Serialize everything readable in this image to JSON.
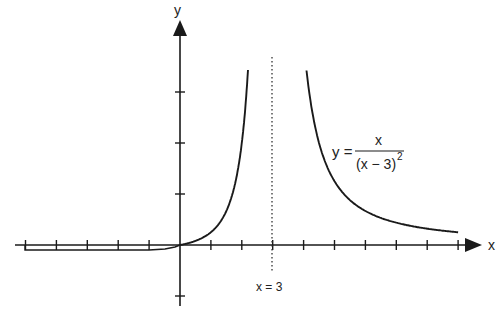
{
  "chart_data": {
    "type": "line",
    "title": "",
    "function": "y = x / (x - 3)^2",
    "xlabel": "x",
    "ylabel": "y",
    "asymptote": {
      "type": "vertical",
      "x": 3,
      "label": "x = 3",
      "style": "dotted"
    },
    "x_ticks": [
      -5,
      -4,
      -3,
      -2,
      -1,
      1,
      2,
      3,
      4,
      5,
      6,
      7,
      8,
      9
    ],
    "y_ticks": [
      -1,
      1,
      2,
      3
    ],
    "xlim": [
      -5.3,
      9.8
    ],
    "ylim": [
      -1.2,
      4.3
    ],
    "series": [
      {
        "name": "left branch",
        "x_range": [
          -5,
          2.3
        ]
      },
      {
        "name": "right branch",
        "x_range": [
          4.0,
          9
        ]
      }
    ],
    "grid": false,
    "legend": "none"
  },
  "labels": {
    "y_axis": "y",
    "x_axis": "x",
    "asymptote": "x = 3",
    "equation_lhs": "y =",
    "equation_numerator": "x",
    "equation_denominator": "(x − 3)",
    "equation_exponent": "2"
  },
  "colors": {
    "ink": "#1a1a1a",
    "background": "#ffffff"
  }
}
